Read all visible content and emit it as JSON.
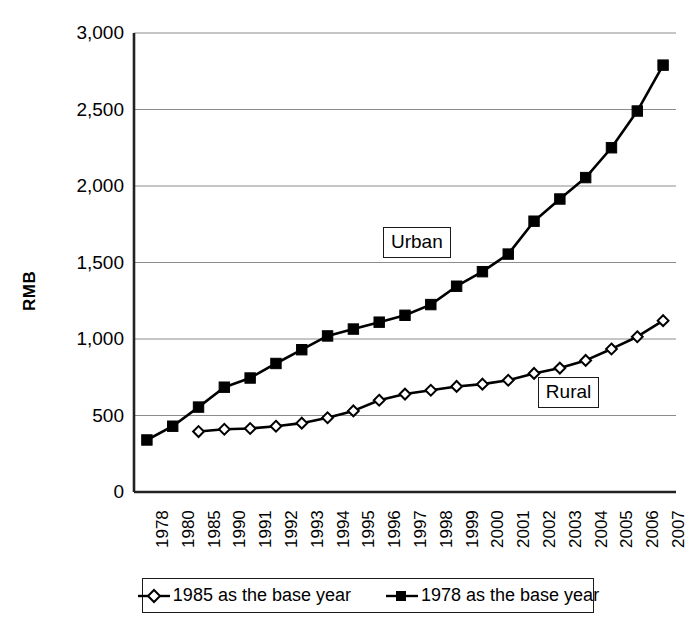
{
  "chart_data": {
    "type": "line",
    "title": "",
    "xlabel": "",
    "ylabel": "RMB",
    "ylim": [
      0,
      3000
    ],
    "yticks": [
      "0",
      "500",
      "1,000",
      "1,500",
      "2,000",
      "2,500",
      "3,000"
    ],
    "ytick_values": [
      0,
      500,
      1000,
      1500,
      2000,
      2500,
      3000
    ],
    "grid": true,
    "legend_position": "bottom",
    "categories": [
      "1978",
      "1980",
      "1985",
      "1990",
      "1991",
      "1992",
      "1993",
      "1994",
      "1995",
      "1996",
      "1997",
      "1998",
      "1999",
      "2000",
      "2001",
      "2002",
      "2003",
      "2004",
      "2005",
      "2006",
      "2007"
    ],
    "series": [
      {
        "name": "1985 as the base year",
        "annotation": "Rural",
        "marker": "open-diamond",
        "color": "#000000",
        "values": [
          null,
          null,
          395,
          410,
          415,
          430,
          450,
          485,
          530,
          600,
          640,
          665,
          690,
          705,
          730,
          775,
          810,
          860,
          935,
          1015,
          1120
        ]
      },
      {
        "name": "1978 as the base year",
        "annotation": "Urban",
        "marker": "filled-square",
        "color": "#000000",
        "values": [
          340,
          430,
          555,
          685,
          745,
          840,
          930,
          1020,
          1065,
          1110,
          1155,
          1225,
          1345,
          1440,
          1555,
          1770,
          1915,
          2055,
          2250,
          2490,
          2790
        ]
      }
    ],
    "annotations": [
      {
        "text": "Urban",
        "x_category": "1997",
        "y_value": 1640
      },
      {
        "text": "Rural",
        "x_category": "2003",
        "y_value": 660
      }
    ]
  },
  "legend": {
    "items": [
      {
        "label": "1985 as the base year",
        "marker": "open-diamond"
      },
      {
        "label": "1978 as the base year",
        "marker": "filled-square"
      }
    ]
  },
  "axis": {
    "y_title": "RMB"
  }
}
